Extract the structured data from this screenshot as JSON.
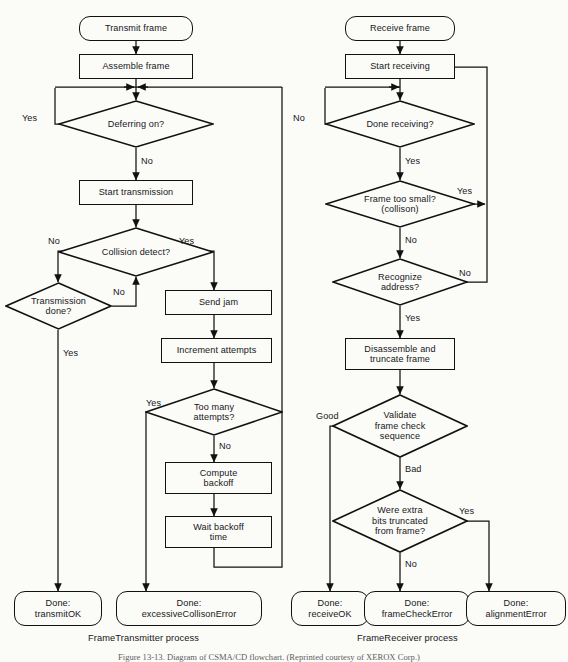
{
  "figure": {
    "type": "flowchart",
    "background": "#fbfbf8",
    "line_color": "#111111",
    "text_color": "#16161a",
    "caption": "Figure 13-13.  Diagram of CSMA/CD flowchart. (Reprinted courtesy of XEROX Corp.)"
  },
  "processes": [
    {
      "name": "FrameTransmitter process",
      "label": "FrameTransmitter process"
    },
    {
      "name": "FrameReceiver process",
      "label": "FrameReceiver process"
    }
  ],
  "transmitter": {
    "start": "Transmit frame",
    "assemble": "Assemble frame",
    "deferring": "Deferring on?",
    "start_transmission": "Start transmission",
    "collision_detect": "Collision detect?",
    "transmission_done": "Transmission\ndone?",
    "send_jam": "Send jam",
    "increment_attempts": "Increment attempts",
    "too_many": "Too many\nattempts?",
    "compute_backoff": "Compute\nbackoff",
    "wait_backoff": "Wait backoff\ntime",
    "done_ok": "Done:\ntransmitOK",
    "done_error": "Done:\nexcessiveCollisonError",
    "edges": {
      "deferring_yes": "Yes",
      "deferring_no": "No",
      "collision_no": "No",
      "collision_yes": "Yes",
      "transmission_done_no": "No",
      "transmission_done_yes": "Yes",
      "too_many_yes": "Yes",
      "too_many_no": "No"
    }
  },
  "receiver": {
    "start": "Receive frame",
    "start_receiving": "Start receiving",
    "done_receiving": "Done receiving?",
    "frame_too_small": "Frame too small?\n(collison)",
    "recognize_address": "Recognize\naddress?",
    "disassemble": "Disassemble and\ntruncate frame",
    "validate_fcs": "Validate\nframe check\nsequence",
    "extra_bits": "Were extra\nbits truncated\nfrom frame?",
    "done_ok": "Done:\nreceiveOK",
    "done_fcs_error": "Done:\nframeCheckError",
    "done_align_error": "Done:\nalignmentError",
    "edges": {
      "done_receiving_no": "No",
      "done_receiving_yes": "Yes",
      "frame_too_small_yes": "Yes",
      "frame_too_small_no": "No",
      "recognize_no": "No",
      "recognize_yes": "Yes",
      "validate_good": "Good",
      "validate_bad": "Bad",
      "extra_bits_yes": "Yes",
      "extra_bits_no": "No"
    }
  }
}
